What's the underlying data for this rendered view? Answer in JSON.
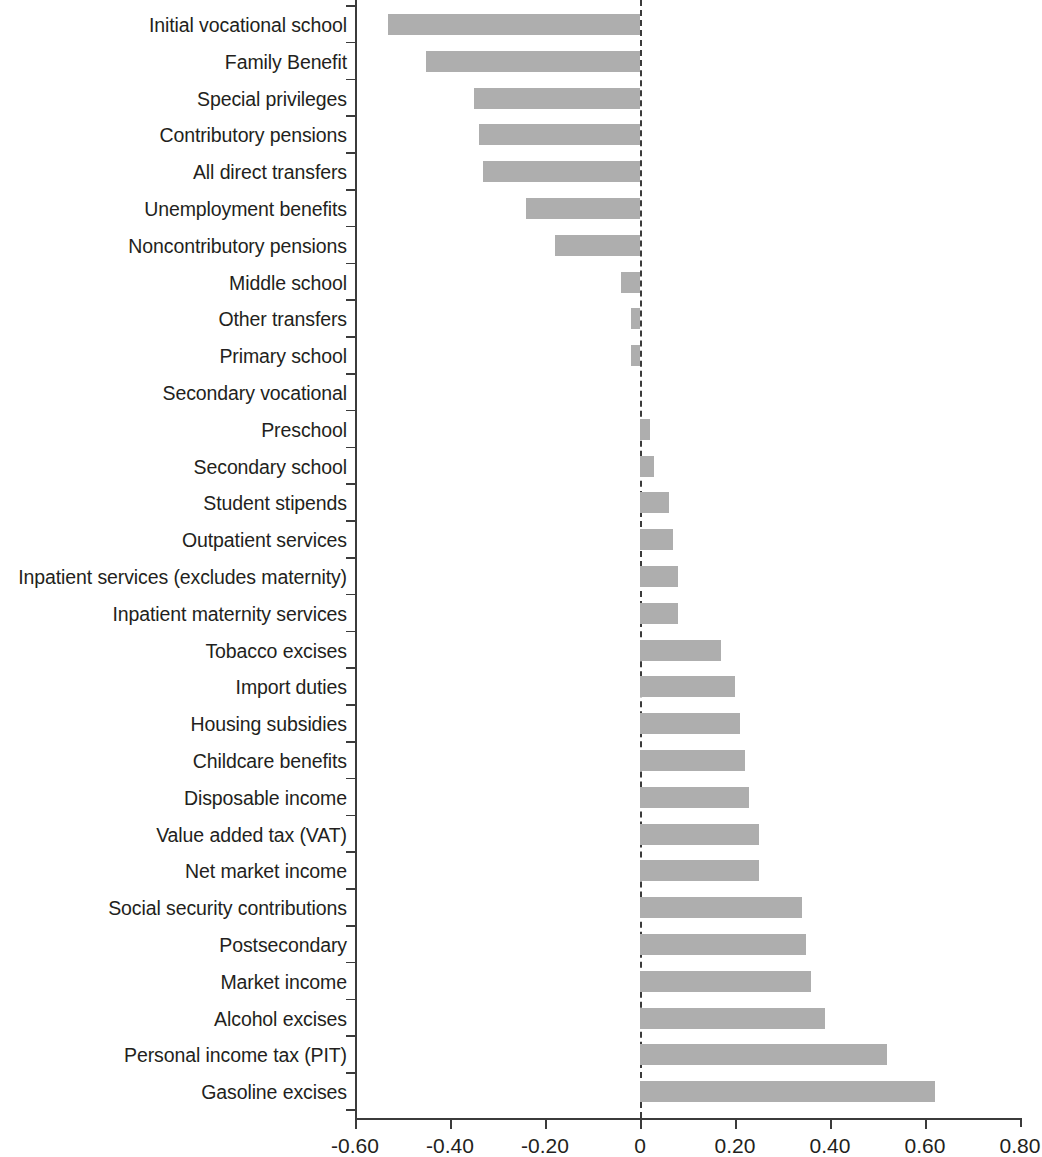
{
  "chart_data": {
    "type": "bar",
    "orientation": "horizontal",
    "title": "",
    "subtitle": "",
    "xlabel": "",
    "ylabel": "",
    "xlim": [
      -0.6,
      0.8
    ],
    "grid": false,
    "legend": null,
    "zero_reference_line": true,
    "bar_color": "#aeaeae",
    "axis_color": "#3b3b3b",
    "xticks": [
      -0.6,
      -0.4,
      -0.2,
      0,
      0.2,
      0.4,
      0.6,
      0.8
    ],
    "xticklabels": [
      "-0.60",
      "-0.40",
      "-0.20",
      "0",
      "0.20",
      "0.40",
      "0.60",
      "0.80"
    ],
    "categories": [
      "Initial vocational school",
      "Family Benefit",
      "Special privileges",
      "Contributory pensions",
      "All direct transfers",
      "Unemployment benefits",
      "Noncontributory pensions",
      "Middle school",
      "Other transfers",
      "Primary school",
      "Secondary vocational",
      "Preschool",
      "Secondary school",
      "Student stipends",
      "Outpatient services",
      "Inpatient services (excludes maternity)",
      "Inpatient maternity services",
      "Tobacco excises",
      "Import duties",
      "Housing subsidies",
      "Childcare benefits",
      "Disposable income",
      "Value added tax (VAT)",
      "Net market income",
      "Social security contributions",
      "Postsecondary",
      "Market income",
      "Alcohol excises",
      "Personal income tax (PIT)",
      "Gasoline excises"
    ],
    "values": [
      -0.53,
      -0.45,
      -0.35,
      -0.34,
      -0.33,
      -0.24,
      -0.18,
      -0.04,
      -0.02,
      -0.02,
      0.0,
      0.02,
      0.03,
      0.06,
      0.07,
      0.08,
      0.08,
      0.17,
      0.2,
      0.21,
      0.22,
      0.23,
      0.25,
      0.25,
      0.34,
      0.35,
      0.36,
      0.39,
      0.52,
      0.62
    ]
  }
}
